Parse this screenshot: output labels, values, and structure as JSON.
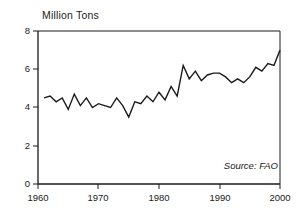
{
  "chart_data": {
    "type": "line",
    "title": "Million Tons",
    "xlabel": "",
    "ylabel": "Million Tons",
    "source": "Source:  FAO",
    "grid": false,
    "legend": "none",
    "xlim": [
      1960,
      2000
    ],
    "ylim": [
      0,
      8
    ],
    "xticks": [
      1960,
      1970,
      1980,
      1990,
      2000
    ],
    "xtick_labels": [
      "1960",
      "1970",
      "1980",
      "1990",
      "2000"
    ],
    "yticks": [
      0,
      2,
      4,
      6,
      8
    ],
    "ytick_labels": [
      "0",
      "2",
      "4",
      "6",
      "8"
    ],
    "line_color": "#1a1a1a",
    "line_width": 1.4,
    "x": [
      1961,
      1962,
      1963,
      1964,
      1965,
      1966,
      1967,
      1968,
      1969,
      1970,
      1971,
      1972,
      1973,
      1974,
      1975,
      1976,
      1977,
      1978,
      1979,
      1980,
      1981,
      1982,
      1983,
      1984,
      1985,
      1986,
      1987,
      1988,
      1989,
      1990,
      1991,
      1992,
      1993,
      1994,
      1995,
      1996,
      1997,
      1998,
      1999,
      2000
    ],
    "values": [
      4.5,
      4.6,
      4.3,
      4.5,
      3.9,
      4.7,
      4.1,
      4.5,
      4.0,
      4.2,
      4.1,
      4.0,
      4.5,
      4.1,
      3.5,
      4.3,
      4.2,
      4.6,
      4.3,
      4.8,
      4.4,
      5.1,
      4.6,
      6.2,
      5.5,
      5.9,
      5.4,
      5.7,
      5.8,
      5.8,
      5.6,
      5.3,
      5.5,
      5.3,
      5.6,
      6.1,
      5.9,
      6.3,
      6.2,
      7.0
    ]
  },
  "axis": {
    "x_labels": [
      "1960",
      "1970",
      "1980",
      "1990",
      "2000"
    ],
    "y_labels": [
      "8",
      "6",
      "4",
      "2",
      "0"
    ]
  }
}
